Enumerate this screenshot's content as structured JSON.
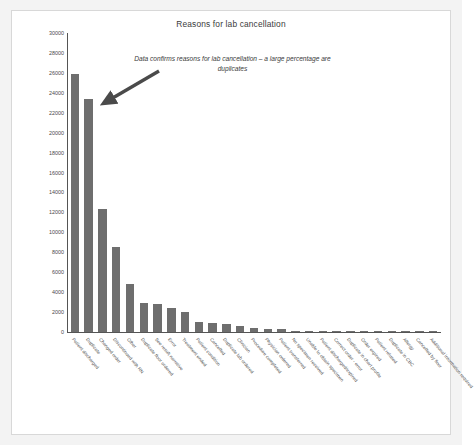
{
  "chart_data": {
    "type": "bar",
    "title": "Reasons for lab cancellation",
    "xlabel": "",
    "ylabel": "",
    "ylim": [
      0,
      30000
    ],
    "ytick_step": 2000,
    "grid": false,
    "legend": null,
    "bar_color": "#6e6e6e",
    "axis_color": "#555555",
    "yticks": [
      "30000",
      "28000",
      "26000",
      "24000",
      "22000",
      "20000",
      "18000",
      "16000",
      "14000",
      "12000",
      "10000",
      "8000",
      "6000",
      "4000",
      "2000",
      "0"
    ],
    "categories": [
      "Patient discharged",
      "Duplicate",
      "Changed order",
      "Discontinued with RN",
      "Other",
      "Duplicate floor ordered",
      "See result narrative",
      "Error",
      "Treatment ended",
      "Patient condition",
      "Cancelled",
      "Duplicate lab ordered",
      "Clinician",
      "Procedure completed",
      "Physician ordered",
      "Patient transferred",
      "No specimen received",
      "Unable to obtain specimen",
      "Patient discharged/expired",
      "Correct order - error",
      "Duplicate in chart profile",
      "Order expired",
      "Patient refused",
      "Duplicate in CBC",
      "Allergy",
      "Cancelled by floor",
      "Additional information required"
    ],
    "values": [
      25900,
      23400,
      12300,
      8550,
      4850,
      2950,
      2780,
      2400,
      1980,
      1020,
      930,
      760,
      620,
      370,
      300,
      300,
      130,
      90,
      85,
      75,
      65,
      55,
      50,
      45,
      40,
      35,
      30
    ],
    "annotations": [
      {
        "text": "Data confirms reasons for lab cancellation – a large percentage are duplicates",
        "style": "italic",
        "arrow": true,
        "arrow_points_to": "Duplicate"
      }
    ]
  }
}
